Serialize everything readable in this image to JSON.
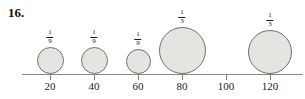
{
  "problem": {
    "number": "16."
  },
  "chart_data": {
    "type": "scatter",
    "title": "",
    "subtitle": "",
    "xlabel": "",
    "ylabel": "",
    "xlim": [
      10,
      130
    ],
    "grid": false,
    "legend": null,
    "axis": {
      "tick_values": [
        20,
        40,
        60,
        80,
        100,
        120
      ],
      "tick_labels": [
        "20",
        "40",
        "60",
        "80",
        "100",
        "120"
      ]
    },
    "bubbles": [
      {
        "x": 20,
        "x_label": "20",
        "diameter_px": 27,
        "label_numerator": "1",
        "label_denominator": "9",
        "label": "1/9"
      },
      {
        "x": 40,
        "x_label": "40",
        "diameter_px": 27,
        "label_numerator": "1",
        "label_denominator": "9",
        "label": "1/9"
      },
      {
        "x": 60,
        "x_label": "60",
        "diameter_px": 25,
        "label_numerator": "1",
        "label_denominator": "9",
        "label": "1/9"
      },
      {
        "x": 80,
        "x_label": "80",
        "diameter_px": 47,
        "label_numerator": "1",
        "label_denominator": "3",
        "label": "1/3"
      },
      {
        "x": 120,
        "x_label": "120",
        "diameter_px": 44,
        "label_numerator": "1",
        "label_denominator": "3",
        "label": "1/3"
      }
    ],
    "colors": {
      "bubble_fill": "#e4e4e1",
      "bubble_stroke": "#6f6f6c",
      "axis": "#888884",
      "text": "#1c1c1c"
    }
  }
}
